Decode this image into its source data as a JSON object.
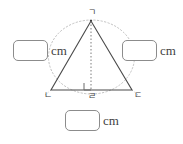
{
  "figure": {
    "vertices": {
      "apex": "ㄱ",
      "bottom_left": "ㄴ",
      "bottom_right": "ㄷ",
      "altitude_foot": "ㄹ"
    },
    "units": {
      "left": "cm",
      "right": "cm",
      "base": "cm"
    },
    "answers": {
      "left_value": "",
      "right_value": "",
      "base_value": "",
      "placeholder": ""
    },
    "markers": {
      "right_angle": "right-angle-square",
      "altitude_style": "dotted",
      "circumscribed_arc_style": "dotted"
    },
    "colors": {
      "background": "#ffffff",
      "triangle_stroke": "#4a4a4a",
      "dotted_stroke": "#b9b9b9",
      "box_border": "#8c8c8c",
      "text": "#3f3f3f"
    },
    "geometry": {
      "apex_point": "91,21",
      "left_point": "51,90",
      "right_point": "132,90",
      "foot_point": "91,90"
    }
  }
}
